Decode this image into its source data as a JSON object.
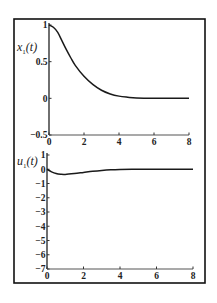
{
  "frame": {
    "left": 14,
    "top": 19,
    "right": 205,
    "bottom": 283
  },
  "chart_data": [
    {
      "type": "line",
      "ylabel": "x1(t)",
      "ylabel_main": "x",
      "ylabel_sub": "1",
      "ylabel_arg": "(t)",
      "xlabel": "",
      "xlim": [
        0,
        8
      ],
      "ylim": [
        -0.5,
        1
      ],
      "xticks": [
        0,
        2,
        4,
        6,
        8
      ],
      "yticks": [
        1,
        0.5,
        0,
        -0.5
      ],
      "ytick_labels": [
        "1",
        "0.5",
        "0",
        "−0.5"
      ],
      "xtick_labels": [
        "0",
        "2",
        "4",
        "6",
        "8"
      ],
      "grid": false,
      "x": [
        0,
        0.25,
        0.5,
        0.75,
        1,
        1.25,
        1.5,
        2,
        2.5,
        3,
        3.5,
        4,
        4.5,
        5,
        6,
        7,
        8
      ],
      "values": [
        1.0,
        0.97,
        0.9,
        0.78,
        0.66,
        0.55,
        0.45,
        0.3,
        0.19,
        0.11,
        0.06,
        0.03,
        0.015,
        0.005,
        0.0,
        0.0,
        0.0
      ],
      "px": {
        "x0": 49,
        "x1": 189,
        "y_top": 25,
        "y_bottom": 135
      }
    },
    {
      "type": "line",
      "ylabel": "u1(t)",
      "ylabel_main": "u",
      "ylabel_sub": "1",
      "ylabel_arg": "(t)",
      "xlabel": "",
      "xlim": [
        0,
        8
      ],
      "ylim": [
        -7,
        1
      ],
      "xticks": [
        0,
        2,
        4,
        6,
        8
      ],
      "yticks": [
        1,
        0,
        -1,
        -2,
        -3,
        -4,
        -5,
        -6,
        -7
      ],
      "ytick_labels": [
        "1",
        "0",
        "−1",
        "−2",
        "−3",
        "−4",
        "−5",
        "−6",
        "−7"
      ],
      "xtick_labels": [
        "0",
        "2",
        "4",
        "6",
        "8"
      ],
      "grid": false,
      "x": [
        0,
        0.25,
        0.5,
        0.75,
        1,
        1.5,
        2,
        2.5,
        3,
        3.5,
        4,
        5,
        6,
        7,
        8
      ],
      "values": [
        0.0,
        -0.18,
        -0.3,
        -0.35,
        -0.36,
        -0.3,
        -0.22,
        -0.14,
        -0.08,
        -0.04,
        -0.02,
        0.0,
        0.0,
        0.0,
        0.0
      ],
      "px": {
        "x0": 47,
        "x1": 193,
        "y_top": 155,
        "y_bottom": 269
      }
    }
  ]
}
